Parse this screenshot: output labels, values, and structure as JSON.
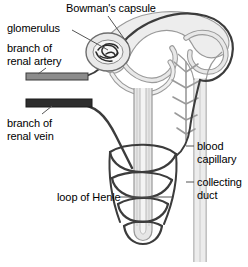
{
  "diagram": {
    "background_color": "#ffffff",
    "style": "black and white line drawing",
    "colors": {
      "outline_dark": "#3a3a3a",
      "outline_black": "#1a1a1a",
      "tubule_fill": "#e3e3e3",
      "tubule_stroke": "#9a9a9a",
      "artery_fill": "#8c8c8c",
      "vein_fill": "#2e2e2e",
      "leader_line": "#555555",
      "text": "#000000"
    },
    "labels": {
      "bowmans_capsule": "Bowman's capsule",
      "glomerulus": "glomerulus",
      "renal_artery": "branch of\nrenal artery",
      "renal_vein": "branch of\nrenal vein",
      "loop_of_henle": "loop of Henle",
      "blood_capillary": "blood\ncapillary",
      "collecting_duct": "collecting\nduct"
    },
    "parts": [
      {
        "name": "Bowman's capsule",
        "side": "top"
      },
      {
        "name": "glomerulus",
        "side": "left"
      },
      {
        "name": "branch of renal artery",
        "side": "left"
      },
      {
        "name": "branch of renal vein",
        "side": "left"
      },
      {
        "name": "loop of Henle",
        "side": "left"
      },
      {
        "name": "blood capillary",
        "side": "right"
      },
      {
        "name": "collecting duct",
        "side": "right"
      }
    ]
  }
}
